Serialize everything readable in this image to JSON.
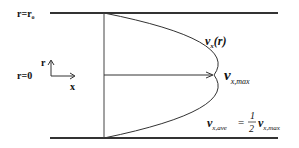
{
  "diagram": {
    "labels": {
      "wall_radius": "r=r",
      "wall_radius_sub": "o",
      "centerline": "r=0",
      "r_axis": "r",
      "x_axis": "x",
      "profile_v": "v",
      "profile_sub": "x",
      "profile_arg": "(r)",
      "vmax_v": "v",
      "vmax_sub": "x,max",
      "ave_v": "v",
      "ave_sub": "x,ave",
      "equals": "=",
      "frac_num": "1",
      "frac_den": "2",
      "ave_rhs_v": "v",
      "ave_rhs_sub": "x,max"
    },
    "colors": {
      "line": "#333333",
      "text": "#111111",
      "background": "#ffffff"
    }
  }
}
